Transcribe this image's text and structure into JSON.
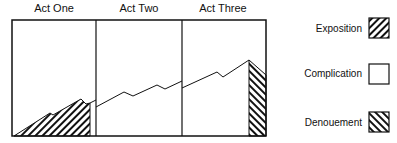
{
  "acts": [
    "Act One",
    "Act Two",
    "Act Three"
  ],
  "legend": [
    {
      "label": "Exposition",
      "pattern": "hatch-back"
    },
    {
      "label": "Complication",
      "pattern": "blank"
    },
    {
      "label": "Denouement",
      "pattern": "hatch-forward"
    }
  ]
}
